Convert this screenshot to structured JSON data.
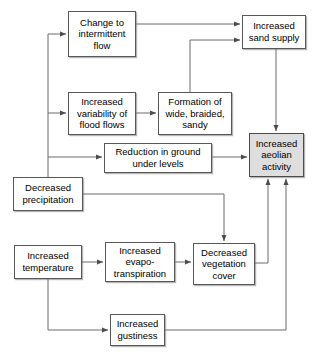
{
  "diagram": {
    "type": "flowchart",
    "colors": {
      "node_fill": "#ffffff",
      "node_border": "#58585a",
      "highlight_fill": "#dedede",
      "edge": "#6b6b6d",
      "text": "#000000"
    },
    "nodes": [
      {
        "id": "change-to-intermittent-flow",
        "label": "Change to\nintermittent\nflow",
        "x": 68,
        "y": 11,
        "w": 68,
        "h": 46,
        "highlight": false
      },
      {
        "id": "increased-sand-supply",
        "label": "Increased\nsand supply",
        "x": 242,
        "y": 15,
        "w": 64,
        "h": 34,
        "highlight": false
      },
      {
        "id": "increased-variability-of-flood-flows",
        "label": "Increased\nvariability of\nflood flows",
        "x": 68,
        "y": 92,
        "w": 68,
        "h": 43,
        "highlight": false
      },
      {
        "id": "formation-of-wide-braided-sandy",
        "label": "Formation of\nwide, braided,\nsandy",
        "x": 158,
        "y": 92,
        "w": 74,
        "h": 43,
        "highlight": false
      },
      {
        "id": "increased-aeolian-activity",
        "label": "Increased\naeolian\nactivity",
        "x": 249,
        "y": 133,
        "w": 55,
        "h": 44,
        "highlight": true
      },
      {
        "id": "reduction-in-ground-under-levels",
        "label": "Reduction in ground\nunder levels",
        "x": 104,
        "y": 143,
        "w": 108,
        "h": 30,
        "highlight": false
      },
      {
        "id": "decreased-precipitation",
        "label": "Decreased\nprecipitation",
        "x": 13,
        "y": 177,
        "w": 70,
        "h": 34,
        "highlight": false
      },
      {
        "id": "increased-temperature",
        "label": "Increased\ntemperature",
        "x": 14,
        "y": 245,
        "w": 68,
        "h": 34,
        "highlight": false
      },
      {
        "id": "increased-evapo-transpiration",
        "label": "Increased\nevapo-\ntranspiration",
        "x": 105,
        "y": 242,
        "w": 70,
        "h": 40,
        "highlight": false
      },
      {
        "id": "decreased-vegetation-cover",
        "label": "Decreased\nvegetation\ncover",
        "x": 193,
        "y": 243,
        "w": 62,
        "h": 42,
        "highlight": false
      },
      {
        "id": "increased-gustiness",
        "label": "Increased\ngustiness",
        "x": 110,
        "y": 314,
        "w": 55,
        "h": 32,
        "highlight": false
      }
    ],
    "edges": [
      {
        "from": "change-to-intermittent-flow",
        "to": "increased-sand-supply",
        "path": "M136,24 L240,24"
      },
      {
        "from": "formation-of-wide-braided-sandy",
        "to": "increased-sand-supply",
        "path": "M190,92 L190,40 L240,40"
      },
      {
        "from": "increased-variability-of-flood-flows",
        "to": "formation-of-wide-braided-sandy",
        "path": "M136,113 L156,113"
      },
      {
        "from": "decreased-precipitation-trunk",
        "to": "change-to-intermittent-flow",
        "path": "M48,177 L48,34 L66,34"
      },
      {
        "from": "decreased-precipitation-trunk",
        "to": "increased-variability-of-flood-flows",
        "path": "M48,113 L66,113"
      },
      {
        "from": "decreased-precipitation-trunk",
        "to": "reduction-in-ground-under-levels",
        "path": "M48,157 L102,157"
      },
      {
        "from": "reduction-in-ground-under-levels",
        "to": "increased-aeolian-activity",
        "path": "M212,157 L247,157"
      },
      {
        "from": "increased-sand-supply",
        "to": "increased-aeolian-activity",
        "path": "M276,49 L276,131"
      },
      {
        "from": "decreased-precipitation",
        "to": "decreased-vegetation-cover",
        "path": "M83,194 L224,194 L224,241"
      },
      {
        "from": "increased-temperature",
        "to": "increased-evapo-transpiration",
        "path": "M82,262 L103,262"
      },
      {
        "from": "increased-evapo-transpiration",
        "to": "decreased-vegetation-cover",
        "path": "M175,262 L191,262"
      },
      {
        "from": "decreased-vegetation-cover",
        "to": "increased-aeolian-activity",
        "path": "M255,263 L268,263 L268,179"
      },
      {
        "from": "increased-temperature",
        "to": "increased-gustiness",
        "path": "M48,279 L48,330 L108,330"
      },
      {
        "from": "increased-gustiness",
        "to": "increased-aeolian-activity",
        "path": "M165,330 L286,330 L286,179"
      }
    ]
  }
}
